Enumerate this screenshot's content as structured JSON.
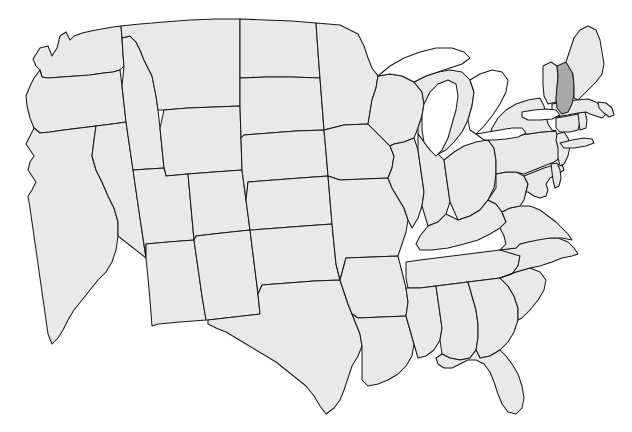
{
  "map": {
    "title": "United States Outline Map",
    "type": "choropleth-outline",
    "region": "contiguous-united-states",
    "projection": "albers-like",
    "background_color": "#ffffff",
    "state_fill_color": "#e9e9e9",
    "highlight_fill_color": "#a9a9a9",
    "border_color": "#1a1a1a",
    "lake_fill_color": "#ffffff",
    "border_width_px": 1,
    "labels_visible": false,
    "legend_visible": false,
    "title_visible": false,
    "highlighted_states": [
      "New Hampshire"
    ],
    "highlight_count": 1,
    "state_count": 49,
    "includes_district_of_columbia": false,
    "includes_alaska": false,
    "includes_hawaii": false,
    "great_lakes_rendered": true,
    "states": [
      {
        "code": "WA",
        "name": "Washington",
        "highlighted": false
      },
      {
        "code": "OR",
        "name": "Oregon",
        "highlighted": false
      },
      {
        "code": "CA",
        "name": "California",
        "highlighted": false
      },
      {
        "code": "NV",
        "name": "Nevada",
        "highlighted": false
      },
      {
        "code": "ID",
        "name": "Idaho",
        "highlighted": false
      },
      {
        "code": "MT",
        "name": "Montana",
        "highlighted": false
      },
      {
        "code": "WY",
        "name": "Wyoming",
        "highlighted": false
      },
      {
        "code": "UT",
        "name": "Utah",
        "highlighted": false
      },
      {
        "code": "AZ",
        "name": "Arizona",
        "highlighted": false
      },
      {
        "code": "CO",
        "name": "Colorado",
        "highlighted": false
      },
      {
        "code": "NM",
        "name": "New Mexico",
        "highlighted": false
      },
      {
        "code": "ND",
        "name": "North Dakota",
        "highlighted": false
      },
      {
        "code": "SD",
        "name": "South Dakota",
        "highlighted": false
      },
      {
        "code": "NE",
        "name": "Nebraska",
        "highlighted": false
      },
      {
        "code": "KS",
        "name": "Kansas",
        "highlighted": false
      },
      {
        "code": "OK",
        "name": "Oklahoma",
        "highlighted": false
      },
      {
        "code": "TX",
        "name": "Texas",
        "highlighted": false
      },
      {
        "code": "MN",
        "name": "Minnesota",
        "highlighted": false
      },
      {
        "code": "IA",
        "name": "Iowa",
        "highlighted": false
      },
      {
        "code": "MO",
        "name": "Missouri",
        "highlighted": false
      },
      {
        "code": "AR",
        "name": "Arkansas",
        "highlighted": false
      },
      {
        "code": "LA",
        "name": "Louisiana",
        "highlighted": false
      },
      {
        "code": "WI",
        "name": "Wisconsin",
        "highlighted": false
      },
      {
        "code": "IL",
        "name": "Illinois",
        "highlighted": false
      },
      {
        "code": "MI",
        "name": "Michigan",
        "highlighted": false
      },
      {
        "code": "IN",
        "name": "Indiana",
        "highlighted": false
      },
      {
        "code": "OH",
        "name": "Ohio",
        "highlighted": false
      },
      {
        "code": "KY",
        "name": "Kentucky",
        "highlighted": false
      },
      {
        "code": "TN",
        "name": "Tennessee",
        "highlighted": false
      },
      {
        "code": "MS",
        "name": "Mississippi",
        "highlighted": false
      },
      {
        "code": "AL",
        "name": "Alabama",
        "highlighted": false
      },
      {
        "code": "GA",
        "name": "Georgia",
        "highlighted": false
      },
      {
        "code": "FL",
        "name": "Florida",
        "highlighted": false
      },
      {
        "code": "SC",
        "name": "South Carolina",
        "highlighted": false
      },
      {
        "code": "NC",
        "name": "North Carolina",
        "highlighted": false
      },
      {
        "code": "VA",
        "name": "Virginia",
        "highlighted": false
      },
      {
        "code": "WV",
        "name": "West Virginia",
        "highlighted": false
      },
      {
        "code": "MD",
        "name": "Maryland",
        "highlighted": false
      },
      {
        "code": "DE",
        "name": "Delaware",
        "highlighted": false
      },
      {
        "code": "PA",
        "name": "Pennsylvania",
        "highlighted": false
      },
      {
        "code": "NJ",
        "name": "New Jersey",
        "highlighted": false
      },
      {
        "code": "NY",
        "name": "New York",
        "highlighted": false
      },
      {
        "code": "CT",
        "name": "Connecticut",
        "highlighted": false
      },
      {
        "code": "RI",
        "name": "Rhode Island",
        "highlighted": false
      },
      {
        "code": "MA",
        "name": "Massachusetts",
        "highlighted": false
      },
      {
        "code": "VT",
        "name": "Vermont",
        "highlighted": false
      },
      {
        "code": "NH",
        "name": "New Hampshire",
        "highlighted": true
      },
      {
        "code": "ME",
        "name": "Maine",
        "highlighted": false
      }
    ],
    "lakes": [
      {
        "name": "Lake Superior"
      },
      {
        "name": "Lake Michigan"
      },
      {
        "name": "Lake Huron"
      },
      {
        "name": "Lake Erie"
      },
      {
        "name": "Lake Ontario"
      }
    ]
  }
}
